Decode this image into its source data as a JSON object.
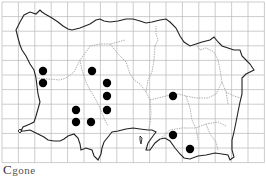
{
  "map": {
    "title": "Distribution map",
    "caption_initial": "C",
    "caption_rest": "gone",
    "grid": {
      "x0": 2,
      "y0": 2,
      "cols": 16,
      "rows": 11,
      "cell_w": 16.4,
      "cell_h": 14.6,
      "color": "#b8b8b8"
    },
    "coast_color": "#222222",
    "parish_color": "#9a9a9a",
    "dot_color": "#000000",
    "dot_radius": 4.2,
    "records": [
      {
        "x": 43,
        "y": 71
      },
      {
        "x": 92,
        "y": 71
      },
      {
        "x": 43,
        "y": 83
      },
      {
        "x": 107,
        "y": 83
      },
      {
        "x": 107,
        "y": 96
      },
      {
        "x": 173,
        "y": 96
      },
      {
        "x": 76,
        "y": 110
      },
      {
        "x": 107,
        "y": 110
      },
      {
        "x": 76,
        "y": 122
      },
      {
        "x": 91,
        "y": 122
      },
      {
        "x": 173,
        "y": 135
      },
      {
        "x": 190,
        "y": 149
      }
    ]
  }
}
